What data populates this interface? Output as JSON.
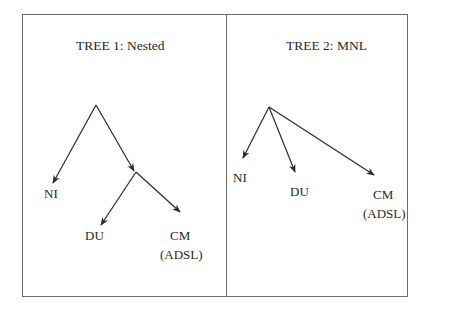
{
  "tree1": {
    "title": "TREE 1: Nested",
    "nodes": {
      "ni": "NI",
      "du": "DU",
      "cm": "CM",
      "cm_sub": "(ADSL)"
    }
  },
  "tree2": {
    "title": "TREE 2: MNL",
    "nodes": {
      "ni": "NI",
      "du": "DU",
      "cm": "CM",
      "cm_sub": "(ADSL)"
    }
  }
}
